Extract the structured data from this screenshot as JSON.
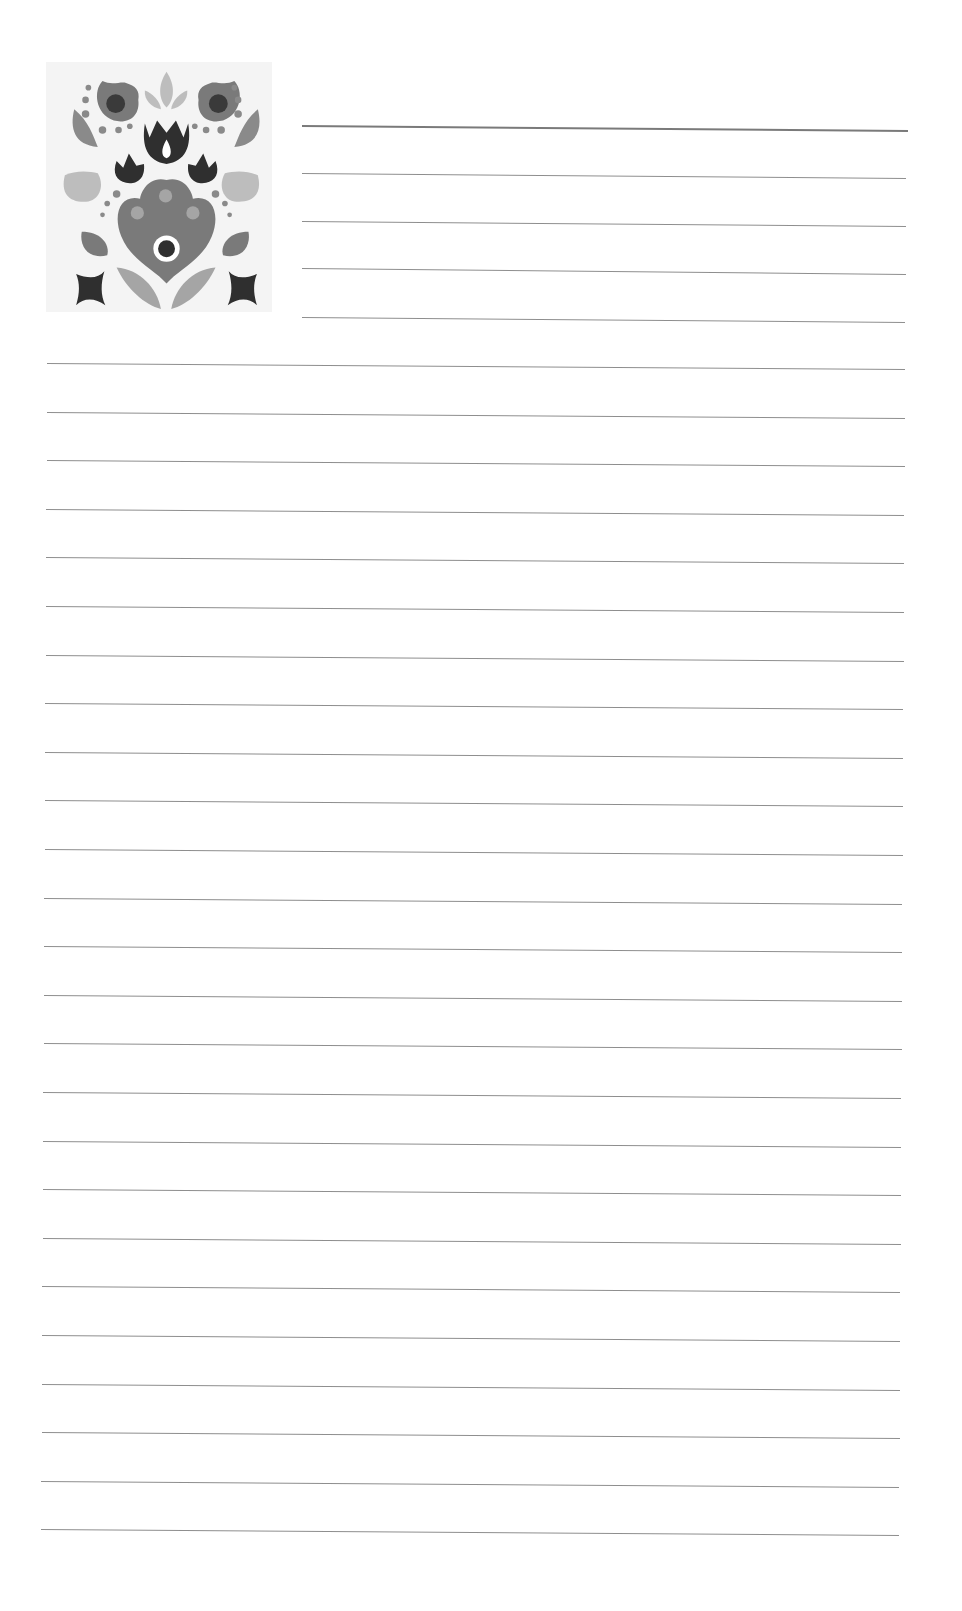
{
  "page": {
    "type": "lined-notepaper",
    "background": "#ffffff",
    "line_color": "#8e8e8e"
  },
  "decoration": {
    "icon": "folk-floral-ornament-icon",
    "colors": [
      "#2f2f2f",
      "#6f6f6f",
      "#9a9a9a",
      "#bdbdbd"
    ]
  },
  "header_lines": [
    {
      "x1": 302,
      "y1": 125,
      "x2": 908,
      "y2": 130,
      "thick": true
    },
    {
      "x1": 302,
      "y1": 173,
      "x2": 906,
      "y2": 178
    },
    {
      "x1": 302,
      "y1": 221,
      "x2": 906,
      "y2": 226
    },
    {
      "x1": 302,
      "y1": 268,
      "x2": 906,
      "y2": 274
    },
    {
      "x1": 302,
      "y1": 317,
      "x2": 905,
      "y2": 322
    }
  ],
  "body_lines": {
    "x1": 47,
    "x2": 905,
    "first_y": 363,
    "spacing": 48.6,
    "count": 25,
    "drift": 6,
    "x_shift_per_line": -0.25
  }
}
